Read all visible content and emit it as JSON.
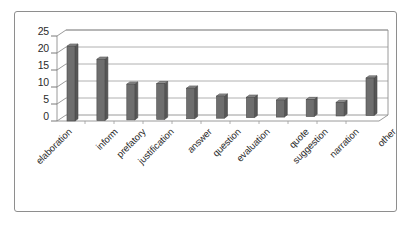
{
  "chart_data": {
    "type": "bar",
    "title": "",
    "xlabel": "",
    "ylabel": "",
    "categories": [
      "elaboration",
      "inform",
      "prefatory",
      "justification",
      "answer",
      "question",
      "evaluation",
      "quote",
      "suggestion",
      "narration",
      "other"
    ],
    "values": [
      22,
      18,
      10.5,
      10.5,
      9,
      6.5,
      6,
      5,
      5,
      4,
      11
    ],
    "ylim": [
      0,
      25
    ],
    "yticks": [
      "0",
      "5",
      "10",
      "15",
      "20",
      "25"
    ],
    "grid": true,
    "legend": "none",
    "style": "3d-column",
    "bar_color": "#6e6e6e",
    "grid_color": "#9d9d9d",
    "axis_color": "#8e8e8e",
    "text_color": "#2b2b2b",
    "background": "#ffffff"
  }
}
